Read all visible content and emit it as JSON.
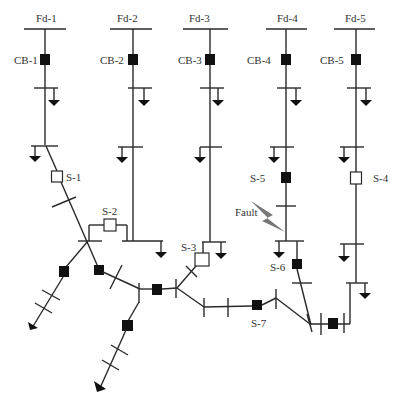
{
  "diagram": {
    "type": "power-distribution-single-line",
    "feeders": [
      {
        "label": "Fd-1",
        "breaker": "CB-1"
      },
      {
        "label": "Fd-2",
        "breaker": "CB-2"
      },
      {
        "label": "Fd-3",
        "breaker": "CB-3"
      },
      {
        "label": "Fd-4",
        "breaker": "CB-4"
      },
      {
        "label": "Fd-5",
        "breaker": "CB-5"
      }
    ],
    "switches": [
      {
        "label": "S-1",
        "state": "open"
      },
      {
        "label": "S-2",
        "state": "open"
      },
      {
        "label": "S-3",
        "state": "open"
      },
      {
        "label": "S-4",
        "state": "open"
      },
      {
        "label": "S-5",
        "state": "closed"
      },
      {
        "label": "S-6",
        "state": "closed"
      },
      {
        "label": "S-7",
        "state": "closed"
      }
    ],
    "fault_label": "Fault",
    "colors": {
      "line": "#2a2a2a",
      "closed_device": "#111111",
      "open_device": "#ffffff",
      "fault_bolt": "#777777",
      "text": "#333333"
    }
  }
}
